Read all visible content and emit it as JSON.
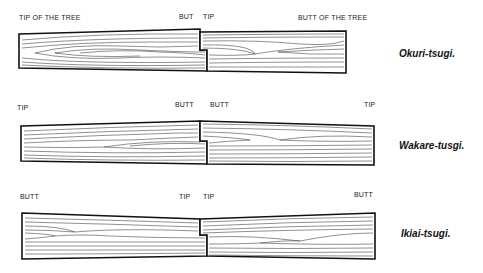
{
  "diagrams": [
    {
      "name": "Okuri-tsugi.",
      "labels": {
        "left_end": "TIP OF THE TREE",
        "joint_left": "BUT",
        "joint_right": "TIP",
        "right_end": "BUTT OF THE TREE"
      }
    },
    {
      "name": "Wakare-tusgi.",
      "labels": {
        "left_end": "TIP",
        "joint_left": "BUTT",
        "joint_right": "BUTT",
        "right_end": "TIP"
      }
    },
    {
      "name": "Ikiai-tsugi.",
      "labels": {
        "left_end": "BUTT",
        "joint_left": "TIP",
        "joint_right": "TIP",
        "right_end": "BUTT"
      }
    }
  ],
  "colors": {
    "outline": "#111111",
    "grain": "#333333",
    "background": "#ffffff"
  }
}
